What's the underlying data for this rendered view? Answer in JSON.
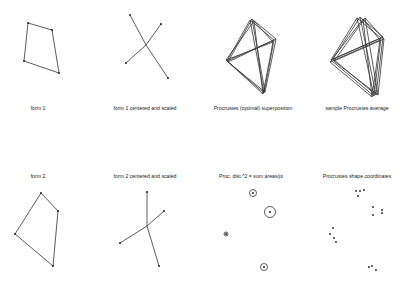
{
  "panels": [
    {
      "id": "form1",
      "label": "form 1",
      "label_pos": [
        38,
        106
      ],
      "type": "polygon",
      "points": [
        [
          28,
          23
        ],
        [
          52,
          30
        ],
        [
          59,
          73
        ],
        [
          24,
          61
        ]
      ]
    },
    {
      "id": "form1_centered",
      "label": "form 1 centered and scaled",
      "label_pos": [
        145,
        106
      ],
      "type": "star",
      "center": [
        146,
        45
      ],
      "points": [
        [
          130,
          15
        ],
        [
          161,
          24
        ],
        [
          168,
          78
        ],
        [
          126,
          63
        ]
      ]
    },
    {
      "id": "procrustes_superposition",
      "label": "Procrustes (optimal) superposition",
      "label_pos": [
        253,
        106
      ],
      "type": "overlay",
      "shapes": [
        [
          [
            250,
            20
          ],
          [
            274,
            40
          ],
          [
            264,
            93
          ],
          [
            227,
            61
          ]
        ],
        [
          [
            252,
            19
          ],
          [
            276,
            39
          ],
          [
            265,
            92
          ],
          [
            228,
            62
          ]
        ],
        [
          [
            254,
            21
          ],
          [
            273,
            42
          ],
          [
            263,
            94
          ],
          [
            226,
            60
          ]
        ]
      ],
      "star_center": [
        257,
        52
      ]
    },
    {
      "id": "procrustes_average",
      "label": "sample Procrustes average",
      "label_pos": [
        357,
        106
      ],
      "type": "overlay",
      "shapes": [
        [
          [
            357,
            18
          ],
          [
            381,
            38
          ],
          [
            374,
            96
          ],
          [
            331,
            60
          ]
        ],
        [
          [
            360,
            17
          ],
          [
            383,
            37
          ],
          [
            376,
            95
          ],
          [
            333,
            59
          ]
        ],
        [
          [
            363,
            19
          ],
          [
            380,
            40
          ],
          [
            372,
            97
          ],
          [
            330,
            62
          ]
        ],
        [
          [
            365,
            18
          ],
          [
            384,
            39
          ],
          [
            378,
            95
          ],
          [
            334,
            61
          ]
        ]
      ],
      "star_center": [
        361,
        53
      ]
    },
    {
      "id": "form2",
      "label": "form 2",
      "label_pos": [
        38,
        174
      ],
      "type": "polygon",
      "points": [
        [
          41,
          193
        ],
        [
          58,
          211
        ],
        [
          53,
          266
        ],
        [
          15,
          234
        ]
      ]
    },
    {
      "id": "form2_centered",
      "label": "form 2 centered and scaled",
      "label_pos": [
        145,
        174
      ],
      "type": "star",
      "center": [
        147,
        226
      ],
      "points": [
        [
          147,
          192
        ],
        [
          164,
          211
        ],
        [
          159,
          266
        ],
        [
          120,
          243
        ]
      ]
    },
    {
      "id": "proc_dist",
      "label": "Proc. dist.^2 = sum areas/pi",
      "label_pos": [
        251,
        174
      ],
      "type": "circles",
      "circles": [
        {
          "c": [
            253,
            193
          ],
          "r": 3.5
        },
        {
          "c": [
            270,
            212
          ],
          "r": 5.5
        },
        {
          "c": [
            226,
            234
          ],
          "r": 2
        },
        {
          "c": [
            264,
            267
          ],
          "r": 3.5
        }
      ]
    },
    {
      "id": "shape_coordinates",
      "label": "Procrustes shape coordinates",
      "label_pos": [
        357,
        174
      ],
      "type": "scatter",
      "points": [
        [
          356,
          191
        ],
        [
          360,
          191
        ],
        [
          364,
          190
        ],
        [
          358,
          196
        ],
        [
          373,
          207
        ],
        [
          373,
          215
        ],
        [
          382,
          210
        ],
        [
          382,
          213
        ],
        [
          333,
          228
        ],
        [
          330,
          234
        ],
        [
          334,
          238
        ],
        [
          336,
          242
        ],
        [
          369,
          267
        ],
        [
          372,
          266
        ],
        [
          376,
          270
        ]
      ]
    }
  ]
}
